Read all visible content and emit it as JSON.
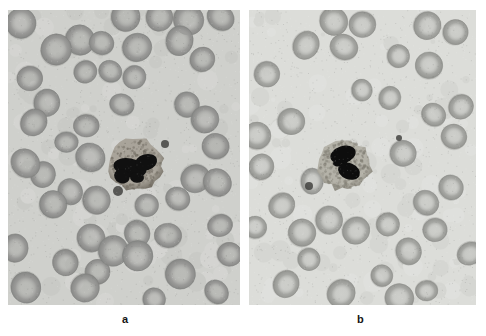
{
  "figure": {
    "type": "micrograph-figure",
    "modality": "light microscopy, peripheral blood smear, Romanowsky-type stain, rendered greyscale",
    "layout": "two panels side by side, labels beneath each panel",
    "background_color": "#ffffff"
  },
  "panels": [
    {
      "id": "a",
      "label": "a",
      "geometry": {
        "x": 8,
        "y": 10,
        "width": 232,
        "height": 295
      },
      "field_color": "#cfd0cc",
      "description": "Dense field of red blood cells with little to no central pallor; a granulocyte with a dark clumped segmented nucleus and granular cytoplasm sits in the lower central area.",
      "red_cells": {
        "count_visible": 48,
        "fill_color": "#9a9a98",
        "edge_color": "#7e7f7d",
        "pallor_color": "#b9bab6",
        "pallor_strength": 0.22,
        "mean_diameter_px": 27,
        "packing": "crowded, many cells touching or overlapping"
      },
      "white_cell": {
        "type": "granulocyte",
        "center_x": 128,
        "center_y": 155,
        "radius_px": 27,
        "cytoplasm_color": "#a9a49a",
        "granule_color": "#6f6a60",
        "nucleus_color": "#101010",
        "nucleus_shape": "large dark band/clumped lobes crossing the cell"
      },
      "platelets": [
        {
          "x": 110,
          "y": 181,
          "r": 5
        },
        {
          "x": 157,
          "y": 134,
          "r": 4
        }
      ]
    },
    {
      "id": "b",
      "label": "b",
      "geometry": {
        "x": 249,
        "y": 10,
        "width": 227,
        "height": 295
      },
      "field_color": "#dcddd9",
      "description": "Sparser field of red blood cells showing distinct bright central pallor; a neutrophil with a dark bilobed nucleus and pale granular cytoplasm lies in the central lower area.",
      "red_cells": {
        "count_visible": 36,
        "fill_color": "#a6a7a3",
        "edge_color": "#8b8c88",
        "pallor_color": "#d4d5d1",
        "pallor_strength": 0.62,
        "mean_diameter_px": 26,
        "packing": "well separated, mostly discrete cells"
      },
      "white_cell": {
        "type": "neutrophil",
        "center_x": 96,
        "center_y": 155,
        "radius_px": 26,
        "cytoplasm_color": "#b4b2a8",
        "granule_color": "#807d73",
        "nucleus_color": "#0d0d0d",
        "nucleus_shape": "two dark lobes joined by a thin filament"
      },
      "platelets": [
        {
          "x": 60,
          "y": 176,
          "r": 4
        },
        {
          "x": 150,
          "y": 128,
          "r": 3
        }
      ]
    }
  ]
}
